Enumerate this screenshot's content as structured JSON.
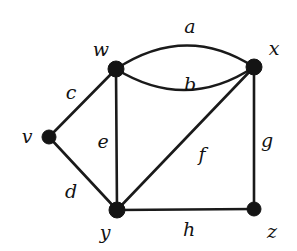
{
  "figure": {
    "kind": "undirected-multigraph-diagram",
    "background_color": "#ffffff",
    "line_color": "#1a1a1a",
    "vertex_color": "#141414",
    "width": 297,
    "height": 251
  },
  "vertices": [
    {
      "id": "v",
      "label": "v",
      "cx": 49,
      "cy": 137,
      "r": 7,
      "label_x": 27,
      "label_y": 136
    },
    {
      "id": "w",
      "label": "w",
      "cx": 116,
      "cy": 69,
      "r": 8,
      "label_x": 101,
      "label_y": 49
    },
    {
      "id": "x",
      "label": "x",
      "cx": 254,
      "cy": 67,
      "r": 8,
      "label_x": 274,
      "label_y": 48
    },
    {
      "id": "y",
      "label": "y",
      "cx": 117,
      "cy": 210,
      "r": 8,
      "label_x": 105,
      "label_y": 232
    },
    {
      "id": "z",
      "label": "z",
      "cx": 254,
      "cy": 209,
      "r": 7,
      "label_x": 272,
      "label_y": 231
    }
  ],
  "edges": [
    {
      "id": "a",
      "label": "a",
      "from": "w",
      "to": "x",
      "shape": "curve-up",
      "d": "M 116 69 Q 186 23 254 67",
      "label_x": 190,
      "label_y": 26
    },
    {
      "id": "b",
      "label": "b",
      "from": "w",
      "to": "x",
      "shape": "curve-down",
      "d": "M 116 69 Q 186 112 254 67",
      "label_x": 190,
      "label_y": 84
    },
    {
      "id": "c",
      "label": "c",
      "from": "v",
      "to": "w",
      "shape": "line",
      "d": "M 49 137 L 116 69",
      "label_x": 71,
      "label_y": 92
    },
    {
      "id": "d",
      "label": "d",
      "from": "v",
      "to": "y",
      "shape": "line",
      "d": "M 49 137 L 117 210",
      "label_x": 71,
      "label_y": 191
    },
    {
      "id": "e",
      "label": "e",
      "from": "w",
      "to": "y",
      "shape": "line",
      "d": "M 116 69 L 117 210",
      "label_x": 103,
      "label_y": 141
    },
    {
      "id": "f",
      "label": "f",
      "from": "x",
      "to": "y",
      "shape": "line",
      "d": "M 254 67 L 117 210",
      "label_x": 202,
      "label_y": 154
    },
    {
      "id": "g",
      "label": "g",
      "from": "x",
      "to": "z",
      "shape": "line",
      "d": "M 254 67 L 254 209",
      "label_x": 267,
      "label_y": 140
    },
    {
      "id": "h",
      "label": "h",
      "from": "y",
      "to": "z",
      "shape": "line",
      "d": "M 117 210 L 254 209",
      "label_x": 189,
      "label_y": 229
    }
  ],
  "chart_data": {
    "type": "diagram",
    "title": "",
    "graph_type": "undirected multigraph",
    "vertex_count": 5,
    "edge_count": 8,
    "vertex_labels": [
      "v",
      "w",
      "x",
      "y",
      "z"
    ],
    "edge_labels": [
      "a",
      "b",
      "c",
      "d",
      "e",
      "f",
      "g",
      "h"
    ],
    "edge_list": [
      [
        "a",
        "w",
        "x"
      ],
      [
        "b",
        "w",
        "x"
      ],
      [
        "c",
        "v",
        "w"
      ],
      [
        "d",
        "v",
        "y"
      ],
      [
        "e",
        "w",
        "y"
      ],
      [
        "f",
        "x",
        "y"
      ],
      [
        "g",
        "x",
        "z"
      ],
      [
        "h",
        "y",
        "z"
      ]
    ],
    "parallel_edges": [
      "a",
      "b"
    ],
    "degrees": {
      "v": 2,
      "w": 4,
      "x": 4,
      "y": 4,
      "z": 2
    }
  }
}
